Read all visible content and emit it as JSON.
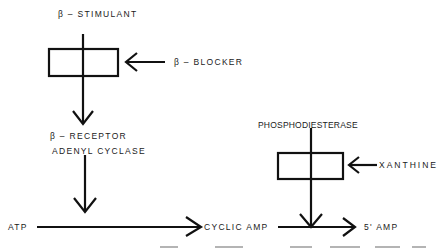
{
  "diagram": {
    "type": "pharmacology-pathway",
    "nodes": {
      "beta_stimulant": "β – STIMULANT",
      "beta_blocker": "β – BLOCKER",
      "beta_receptor": "β – RECEPTOR",
      "adenyl_cyclase": "ADENYL CYCLASE",
      "phosphodiesterase": "PHOSPHODIESTERASE",
      "xanthine": "XANTHINE",
      "atp": "ATP",
      "cyclic_amp": "CYCLIC AMP",
      "five_amp": "5' AMP"
    },
    "edges": [
      {
        "from": "beta_stimulant",
        "to": "beta_receptor",
        "via": "block-box-1"
      },
      {
        "from": "beta_blocker",
        "to": "block-box-1",
        "kind": "inhibits"
      },
      {
        "from": "adenyl_cyclase",
        "to": "atp-cyclic-amp-conversion"
      },
      {
        "from": "atp",
        "to": "cyclic_amp"
      },
      {
        "from": "phosphodiesterase",
        "to": "cyclic-amp-5amp-conversion",
        "via": "block-box-2"
      },
      {
        "from": "xanthine",
        "to": "block-box-2",
        "kind": "inhibits"
      },
      {
        "from": "cyclic_amp",
        "to": "five_amp"
      }
    ],
    "colors": {
      "line": "#111111",
      "background": "#ffffff"
    }
  }
}
